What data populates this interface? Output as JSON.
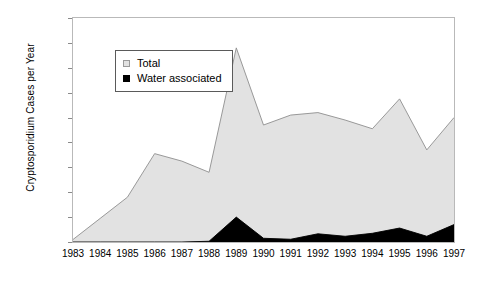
{
  "chart_data": {
    "type": "area",
    "title": "",
    "xlabel": "",
    "ylabel": "Cryptosporidium Cases per Year",
    "categories": [
      "1983",
      "1984",
      "1985",
      "1986",
      "1987",
      "1988",
      "1989",
      "1990",
      "1991",
      "1992",
      "1993",
      "1994",
      "1995",
      "1996",
      "1997"
    ],
    "x": [
      1983,
      1984,
      1985,
      1986,
      1987,
      1988,
      1989,
      1990,
      1991,
      1992,
      1993,
      1994,
      1995,
      1996,
      1997
    ],
    "series": [
      {
        "name": "Total",
        "color": "#e2e2e2",
        "values": [
          100,
          950,
          1800,
          3550,
          3250,
          2800,
          7800,
          4700,
          5100,
          5200,
          4900,
          4550,
          5750,
          3700,
          5000
        ]
      },
      {
        "name": "Water associated",
        "color": "#000000",
        "values": [
          0,
          0,
          0,
          0,
          0,
          30,
          1000,
          150,
          110,
          330,
          230,
          350,
          560,
          230,
          700
        ]
      }
    ],
    "ylim": [
      0,
      9000
    ],
    "yticks": [
      0,
      1000,
      2000,
      3000,
      4000,
      5000,
      6000,
      7000,
      8000,
      9000
    ],
    "ytick_labels": [
      "0",
      "1000",
      "2000",
      "3000",
      "4000",
      "5000",
      "6000",
      "7000",
      "8000",
      "9000"
    ],
    "grid": false,
    "legend_position": "upper-left-inside",
    "stacked": false
  },
  "legend": {
    "entries": [
      {
        "label": "Total",
        "marker": "total-swatch-icon"
      },
      {
        "label": "Water associated",
        "marker": "water-associated-swatch-icon"
      }
    ]
  },
  "colors": {
    "total_fill": "#e2e2e2",
    "total_line": "#8f8f8f",
    "water_fill": "#000000",
    "axis": "#b9b9b9",
    "background": "#ffffff",
    "text": "#000000"
  }
}
